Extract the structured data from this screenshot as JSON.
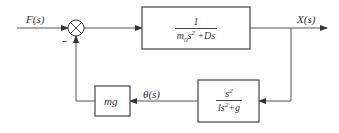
{
  "diagram": {
    "type": "block-diagram",
    "input": {
      "label": "F(s)"
    },
    "summing_junction": {
      "symbol": "⊗",
      "feedback_sign": "−"
    },
    "forward_block": {
      "numerator": "1",
      "denominator_parts": [
        "m",
        "0",
        "s",
        "2",
        " +Ds"
      ]
    },
    "output": {
      "label": "X(s)"
    },
    "feedback_block_1": {
      "numerator_parts": [
        "s",
        "2"
      ],
      "denominator_parts": [
        "ls",
        "2",
        "+g"
      ]
    },
    "intermediate_signal": {
      "label": "θ(s)"
    },
    "feedback_block_2": {
      "label": "mg"
    },
    "colors": {
      "line": "#555555",
      "text": "#333333",
      "background": "#ffffff"
    }
  }
}
